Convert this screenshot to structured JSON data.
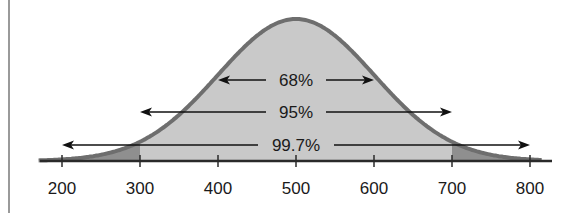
{
  "chart_data": {
    "type": "area",
    "title": "",
    "xlabel": "",
    "ylabel": "",
    "distribution": "normal",
    "mean": 500,
    "std_dev": 100,
    "xlim": [
      175,
      825
    ],
    "x_ticks": [
      200,
      300,
      400,
      500,
      600,
      700,
      800
    ],
    "x_tick_labels": [
      "200",
      "300",
      "400",
      "500",
      "600",
      "700",
      "800"
    ],
    "grid": false,
    "legend": null,
    "annotations": [
      {
        "label": "68%",
        "from": 400,
        "to": 600
      },
      {
        "label": "95%",
        "from": 300,
        "to": 700
      },
      {
        "label": "99.7%",
        "from": 200,
        "to": 800
      }
    ],
    "shaded_regions": [
      {
        "from": 175,
        "to": 300,
        "shade": "dark"
      },
      {
        "from": 300,
        "to": 700,
        "shade": "light"
      },
      {
        "from": 700,
        "to": 825,
        "shade": "dark"
      }
    ]
  },
  "colors": {
    "fill_light": "#c9c9c9",
    "fill_dark": "#8f8f8f",
    "curve": "#6e6e6e",
    "axis": "#2a2a2a",
    "arrow": "#111111",
    "left_rule": "#9a9a9a"
  }
}
